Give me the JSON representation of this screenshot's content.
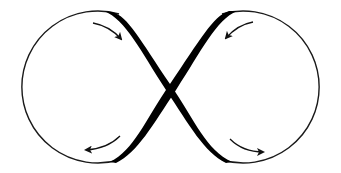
{
  "diagram": {
    "type": "figure-eight-loop",
    "colors": {
      "background": "#ffffff",
      "stroke": "#1a1a1a",
      "crossing": "#000000"
    },
    "loops": [
      {
        "name": "left-loop",
        "flow": "counter-clockwise"
      },
      {
        "name": "right-loop",
        "flow": "clockwise"
      }
    ],
    "arrows": [
      {
        "name": "arrow-top-left",
        "direction": "down-right"
      },
      {
        "name": "arrow-bottom-left",
        "direction": "left"
      },
      {
        "name": "arrow-top-right",
        "direction": "down-left"
      },
      {
        "name": "arrow-bottom-right",
        "direction": "right"
      }
    ]
  }
}
